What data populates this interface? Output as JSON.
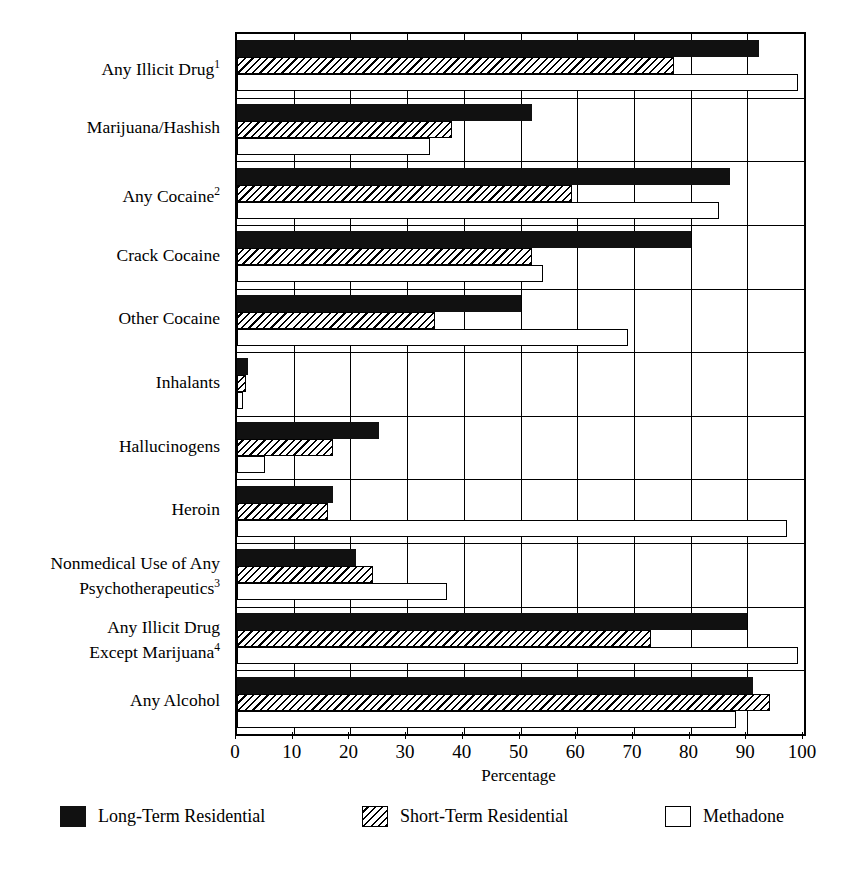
{
  "chart_data": {
    "type": "bar",
    "orientation": "horizontal",
    "title": "",
    "xlabel": "Percentage",
    "ylabel": "",
    "xlim": [
      0,
      100
    ],
    "xticks": [
      0,
      10,
      20,
      30,
      40,
      50,
      60,
      70,
      80,
      90,
      100
    ],
    "grid": true,
    "legend_position": "bottom",
    "categories": [
      "Any Illicit Drug",
      "Marijuana/Hashish",
      "Any Cocaine",
      "Crack Cocaine",
      "Other Cocaine",
      "Inhalants",
      "Hallucinogens",
      "Heroin",
      "Nonmedical Use of Any\nPsychotherapeutics",
      "Any Illicit Drug\nExcept Marijuana",
      "Any Alcohol"
    ],
    "category_footnotes": [
      "1",
      "",
      "2",
      "",
      "",
      "",
      "",
      "",
      "3",
      "4",
      ""
    ],
    "series": [
      {
        "name": "Long-Term Residential",
        "fill": "solid",
        "values": [
          92,
          52,
          87,
          80,
          50,
          2,
          25,
          17,
          21,
          90,
          91
        ]
      },
      {
        "name": "Short-Term Residential",
        "fill": "hatch",
        "values": [
          77,
          38,
          59,
          52,
          35,
          1.5,
          17,
          16,
          24,
          73,
          94
        ]
      },
      {
        "name": "Methadone",
        "fill": "open",
        "values": [
          99,
          34,
          85,
          54,
          69,
          1,
          5,
          97,
          37,
          99,
          88
        ]
      }
    ]
  },
  "legend": {
    "entries": [
      {
        "label": "Long-Term Residential",
        "fill": "solid"
      },
      {
        "label": "Short-Term Residential",
        "fill": "hatch"
      },
      {
        "label": "Methadone",
        "fill": "open"
      }
    ]
  },
  "colors": {
    "axis": "#000000",
    "long_term_residential": "#111111",
    "short_term_residential": "#ffffff",
    "methadone": "#ffffff",
    "background": "#ffffff"
  }
}
